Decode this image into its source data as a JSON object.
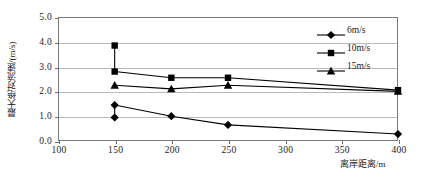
{
  "chart_data": {
    "type": "line",
    "title": "",
    "xlabel": "离岸距离/m",
    "ylabel": "最大绝对流速/(m/s)",
    "xlim": [
      100,
      400
    ],
    "ylim": [
      0.0,
      5.0
    ],
    "xticks": [
      100,
      150,
      200,
      250,
      300,
      350,
      400
    ],
    "xticklabels": [
      "100",
      "150",
      "200",
      "250",
      "300",
      "350",
      "400"
    ],
    "yticks": [
      0.0,
      1.0,
      2.0,
      3.0,
      4.0,
      5.0
    ],
    "yticklabels": [
      "0.0",
      "1.0",
      "2.0",
      "3.0",
      "4.0",
      "5.0"
    ],
    "grid": "horizontal",
    "legend_position": "upper-right",
    "x": [
      150,
      200,
      250,
      400
    ],
    "series": [
      {
        "name": "6m/s",
        "marker": "diamond",
        "color": "#000000",
        "values": [
          1.45,
          1.0,
          0.65,
          0.28
        ],
        "extra_points": [
          {
            "x": 150,
            "y": 0.95
          }
        ]
      },
      {
        "name": "10m/s",
        "marker": "square",
        "color": "#000000",
        "values": [
          2.8,
          2.55,
          2.55,
          2.05
        ],
        "extra_points": [
          {
            "x": 150,
            "y": 3.85
          }
        ]
      },
      {
        "name": "15m/s",
        "marker": "triangle",
        "color": "#000000",
        "values": [
          2.25,
          2.1,
          2.25,
          2.0
        ],
        "extra_points": []
      }
    ]
  },
  "legend": {
    "items": [
      {
        "label": "6m/s",
        "marker": "diamond"
      },
      {
        "label": "10m/s",
        "marker": "square"
      },
      {
        "label": "15m/s",
        "marker": "triangle"
      }
    ]
  }
}
